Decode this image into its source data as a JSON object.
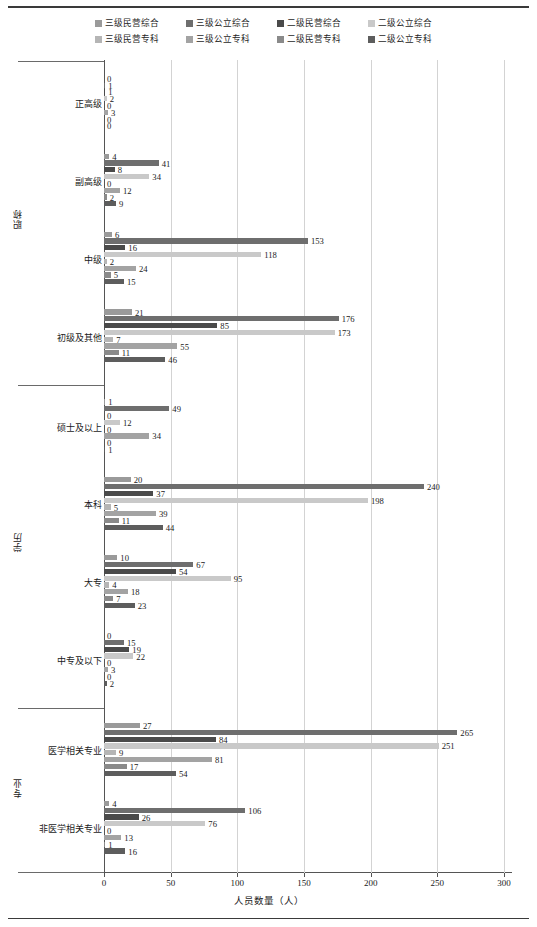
{
  "legend": {
    "items": [
      {
        "label": "三级民营综合",
        "color": "#9a9a9a"
      },
      {
        "label": "三级公立综合",
        "color": "#6e6e6e"
      },
      {
        "label": "二级民营综合",
        "color": "#4a4a4a"
      },
      {
        "label": "二级公立综合",
        "color": "#c9c9c9"
      },
      {
        "label": "三级民营专科",
        "color": "#b5b5b5"
      },
      {
        "label": "三级公立专科",
        "color": "#a3a3a3"
      },
      {
        "label": "二级民营专科",
        "color": "#8a8a8a"
      },
      {
        "label": "二级公立专科",
        "color": "#5d5d5d"
      }
    ]
  },
  "axis": {
    "x_title": "人员数量（人）",
    "x_ticks": [
      0,
      50,
      100,
      150,
      200,
      250,
      300
    ],
    "x_min": 0,
    "x_max": 300,
    "group_labels": [
      "职称",
      "学历",
      "专业"
    ]
  },
  "chart_data": {
    "type": "bar",
    "orientation": "horizontal",
    "title": "",
    "xlabel": "人员数量（人）",
    "ylabel": "",
    "xlim": [
      0,
      300
    ],
    "grid": true,
    "legend_position": "top",
    "categories": [
      "正高级",
      "副高级",
      "中级",
      "初级及其他",
      "硕士及以上",
      "本科",
      "大专",
      "中专及以下",
      "医学相关专业",
      "非医学相关专业"
    ],
    "category_groups": [
      {
        "name": "职称",
        "categories": [
          "正高级",
          "副高级",
          "中级",
          "初级及其他"
        ]
      },
      {
        "name": "学历",
        "categories": [
          "硕士及以上",
          "本科",
          "大专",
          "中专及以下"
        ]
      },
      {
        "name": "专业",
        "categories": [
          "医学相关专业",
          "非医学相关专业"
        ]
      }
    ],
    "series": [
      {
        "name": "三级民营综合",
        "color": "#9a9a9a",
        "values": [
          0,
          4,
          6,
          21,
          1,
          20,
          10,
          0,
          27,
          4
        ]
      },
      {
        "name": "三级公立综合",
        "color": "#6e6e6e",
        "values": [
          1,
          41,
          153,
          176,
          49,
          240,
          67,
          15,
          265,
          106
        ]
      },
      {
        "name": "二级民营综合",
        "color": "#4a4a4a",
        "values": [
          1,
          8,
          16,
          85,
          0,
          37,
          54,
          19,
          84,
          26
        ]
      },
      {
        "name": "二级公立综合",
        "color": "#c9c9c9",
        "values": [
          2,
          34,
          118,
          173,
          12,
          198,
          95,
          22,
          251,
          76
        ]
      },
      {
        "name": "三级民营专科",
        "color": "#b5b5b5",
        "values": [
          0,
          0,
          2,
          7,
          0,
          5,
          4,
          0,
          9,
          0
        ]
      },
      {
        "name": "三级公立专科",
        "color": "#a3a3a3",
        "values": [
          3,
          12,
          24,
          55,
          34,
          39,
          18,
          3,
          81,
          13
        ]
      },
      {
        "name": "二级民营专科",
        "color": "#8a8a8a",
        "values": [
          0,
          2,
          5,
          11,
          0,
          11,
          7,
          0,
          17,
          1
        ]
      },
      {
        "name": "二级公立专科",
        "color": "#5d5d5d",
        "values": [
          0,
          9,
          15,
          46,
          1,
          44,
          23,
          2,
          54,
          16
        ]
      }
    ]
  }
}
